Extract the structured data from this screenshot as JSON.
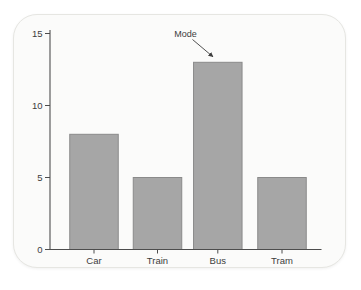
{
  "page": {
    "background_color": "#ffffff"
  },
  "card": {
    "background_color": "#fbfbfa",
    "border_color": "#e6e6e2"
  },
  "chart_data": {
    "type": "bar",
    "categories": [
      "Car",
      "Train",
      "Bus",
      "Tram"
    ],
    "values": [
      8,
      5,
      13,
      5
    ],
    "title": "",
    "xlabel": "",
    "ylabel": "",
    "ylim": [
      0,
      15
    ],
    "yticks": [
      0,
      5,
      10,
      15
    ],
    "grid": false,
    "legend": false,
    "annotation": {
      "label": "Mode",
      "target_category": "Bus",
      "target_value": 13
    },
    "bar_fill": "#a6a6a6",
    "bar_stroke": "#8a8a8a",
    "axis_color": "#4d4d4d",
    "text_color": "#3d3d3d"
  }
}
